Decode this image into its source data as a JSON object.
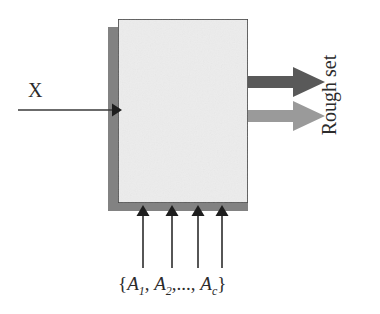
{
  "diagram": {
    "input_label": "X",
    "output_label": "Rough set",
    "attributes_label": {
      "open_brace": "{",
      "a1": "A",
      "a1_sub": "1",
      "sep1": ", ",
      "a2": "A",
      "a2_sub": "2",
      "ellipsis": ",..., ",
      "ac": "A",
      "ac_sub": "c",
      "close_brace": "}",
      "full_text": "{A1, A2,..., Ac}"
    },
    "box": {
      "fill_color": "#ececec",
      "border_color": "#3a3a3a",
      "shadow_color": "#828282"
    },
    "arrows": {
      "input_arrow_color": "#3a3a3a",
      "output_arrow_primary_color": "#595959",
      "output_arrow_secondary_color": "#9a9a9a",
      "attribute_arrow_color": "#1e1e1e",
      "attribute_arrow_count": 4
    }
  }
}
